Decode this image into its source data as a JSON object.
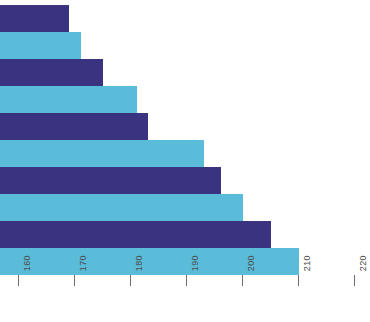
{
  "chart_data": {
    "type": "bar",
    "orientation": "horizontal",
    "title": "",
    "subtitle": "",
    "xlabel": "",
    "ylabel": "",
    "categories": [
      "1",
      "2",
      "3",
      "4",
      "5",
      "6",
      "7",
      "8",
      "9",
      "10"
    ],
    "values": [
      169,
      171,
      175,
      181,
      183,
      193,
      196,
      200,
      205,
      210
    ],
    "bar_colors": [
      "#3a3480",
      "#5bbcd9",
      "#3a3480",
      "#5bbcd9",
      "#3a3480",
      "#5bbcd9",
      "#3a3480",
      "#5bbcd9",
      "#3a3480",
      "#5bbcd9"
    ],
    "xlim": [
      155,
      222
    ],
    "ylim": [
      0,
      10
    ],
    "x_ticks": [
      160,
      170,
      180,
      190,
      200,
      210,
      220
    ],
    "x_tick_labels": [
      "160",
      "170",
      "180",
      "190",
      "200",
      "210",
      "220"
    ],
    "x_tick_label_rotation": -90,
    "grid": false,
    "legend": null,
    "legend_position": "none",
    "axis_line": false,
    "annotations": []
  },
  "style": {
    "background": "#ffffff",
    "dark_series_color": "#3a3480",
    "light_series_color": "#5bbcd9",
    "tick_color": "#6e6e6e",
    "tick_text_color": "#4a4a4a"
  }
}
